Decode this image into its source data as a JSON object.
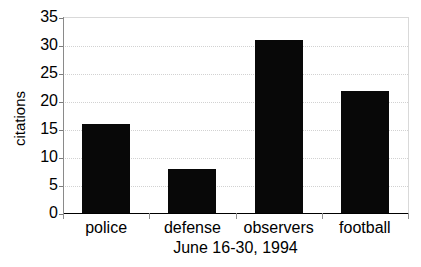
{
  "chart_data": {
    "type": "bar",
    "title": "",
    "subtitle": "",
    "categories": [
      "police",
      "defense",
      "observers",
      "football"
    ],
    "values": [
      16,
      8,
      31,
      22
    ],
    "series": [
      {
        "name": "citations",
        "values": [
          16,
          8,
          31,
          22
        ]
      }
    ],
    "xlabel": "June 16-30, 1994",
    "ylabel": "citations",
    "ylim": [
      0,
      35
    ],
    "yticks": [
      0,
      5,
      10,
      15,
      20,
      25,
      30,
      35
    ],
    "ytick_labels": [
      "0",
      "5",
      "10",
      "15",
      "20",
      "25",
      "30",
      "35"
    ],
    "grid": true,
    "grid_axis": "y",
    "grid_style": "dotted",
    "legend": false,
    "legend_position": "none",
    "bar_color": "#080808",
    "grid_color": "#d2d2d2",
    "axis_color": "#000000",
    "background_color": "#ffffff",
    "annotations": []
  }
}
